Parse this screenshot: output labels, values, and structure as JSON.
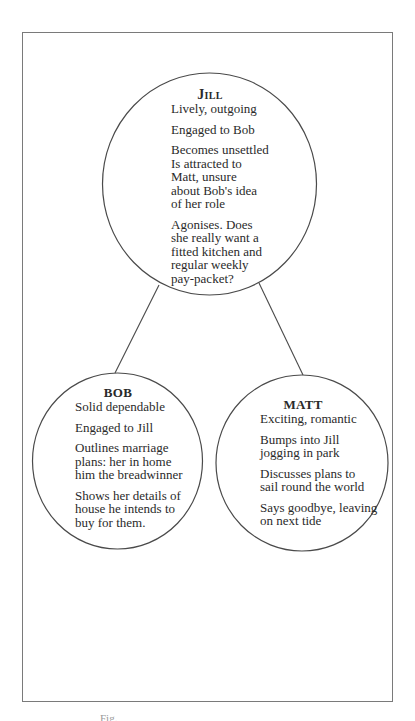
{
  "figure": {
    "caption": "Fig."
  },
  "colors": {
    "line": "#4a4a4a",
    "frame": "#7a7a7a",
    "text": "#2a2a2a"
  },
  "nodes": {
    "jill": {
      "title": "Jill",
      "paragraphs": [
        "Lively, outgoing",
        "Engaged to Bob",
        "Becomes unsettled\nIs attracted to\nMatt, unsure\nabout Bob's idea\nof her role",
        "Agonises. Does\nshe really want a\nfitted kitchen and\nregular weekly\npay-packet?"
      ]
    },
    "bob": {
      "title": "BOB",
      "paragraphs": [
        "Solid dependable",
        "Engaged to Jill",
        "Outlines marriage\nplans: her in home\nhim the breadwinner",
        "Shows her details of\nhouse he intends to\nbuy for them."
      ]
    },
    "matt": {
      "title": "MATT",
      "paragraphs": [
        "Exciting, romantic",
        "Bumps into Jill\njogging in park",
        "Discusses plans to\nsail round the world",
        "Says goodbye, leaving\non next tide"
      ]
    }
  },
  "edges": [
    {
      "from": "jill",
      "to": "bob"
    },
    {
      "from": "jill",
      "to": "matt"
    }
  ]
}
